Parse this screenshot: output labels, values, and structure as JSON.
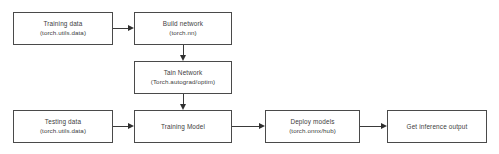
{
  "diagram": {
    "background_color": "#ffffff",
    "border_color": "#4a4a4a",
    "text_color": "#3d3d3d",
    "arrow_color": "#2f2f2f",
    "nodes": [
      {
        "id": "training-data",
        "title": "Training data",
        "sub": "(torch.utils.data)"
      },
      {
        "id": "build-network",
        "title": "Build network",
        "sub": "(torch.nn)"
      },
      {
        "id": "tain-network",
        "title": "Tain Network",
        "sub": "(Torch.autograd/optim)"
      },
      {
        "id": "testing-data",
        "title": "Testing data",
        "sub": "(torch.utils.data)"
      },
      {
        "id": "training-model",
        "title": "Training Model",
        "sub": ""
      },
      {
        "id": "deploy-models",
        "title": "Deploy models",
        "sub": "(torch.onnx/hub)"
      },
      {
        "id": "get-inference-output",
        "title": "Get inference output",
        "sub": ""
      }
    ],
    "edges": [
      {
        "id": "training-data-to-build-network",
        "from": "training-data",
        "to": "build-network",
        "direction": "right"
      },
      {
        "id": "build-network-to-tain-network",
        "from": "build-network",
        "to": "tain-network",
        "direction": "down"
      },
      {
        "id": "tain-network-to-training-model",
        "from": "tain-network",
        "to": "training-model",
        "direction": "down"
      },
      {
        "id": "testing-data-to-training-model",
        "from": "testing-data",
        "to": "training-model",
        "direction": "right"
      },
      {
        "id": "training-model-to-deploy-models",
        "from": "training-model",
        "to": "deploy-models",
        "direction": "right"
      },
      {
        "id": "deploy-models-to-get-inference-output",
        "from": "deploy-models",
        "to": "get-inference-output",
        "direction": "right"
      }
    ]
  }
}
